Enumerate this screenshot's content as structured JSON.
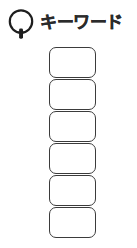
{
  "page": {
    "background_color": "#ffffff",
    "width": 137,
    "height": 248
  },
  "header": {
    "icon": "magnifier-icon",
    "icon_color": "#1e1e1e",
    "title": "キーワード",
    "title_color": "#2b2b2b"
  },
  "keyword_list": {
    "label": "キーワード",
    "box_count": 6,
    "border_color": "#3b3b3b",
    "fill_color": "#ffffff",
    "items": [
      {
        "value": "",
        "placeholder": ""
      },
      {
        "value": "",
        "placeholder": ""
      },
      {
        "value": "",
        "placeholder": ""
      },
      {
        "value": "",
        "placeholder": ""
      },
      {
        "value": "",
        "placeholder": ""
      },
      {
        "value": "",
        "placeholder": ""
      }
    ]
  }
}
